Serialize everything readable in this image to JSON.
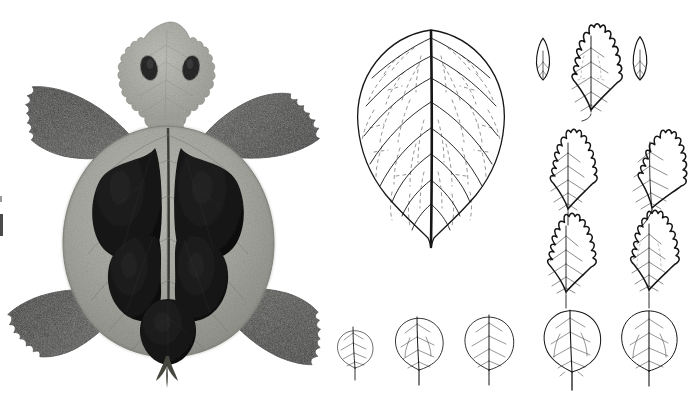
{
  "plate": {
    "title": "Leaf-composition turtle and comparative leaf outline drawings",
    "background_color": "#ffffff",
    "width": 695,
    "height": 408,
    "medium": "grayscale photographic collage (left) and pen line drawings (right)"
  },
  "palette": {
    "background": "#ffffff",
    "ink": "#1a1a1a",
    "vein_light": "#8a8a8a",
    "shell_light": "#a9a9a4",
    "shell_mid": "#9b9b96",
    "spot_dark": "#151515",
    "flipper_dark": "#4a4a48",
    "head_light": "#b4b4ae"
  },
  "left_panel": {
    "name": "leaf-turtle-collage",
    "caption": "Turtle figure assembled from pressed leaves",
    "parts": [
      {
        "id": "head",
        "label": "Head",
        "description": "pale gray crenate leaf, apex up",
        "tone": "#b4b4ae"
      },
      {
        "id": "eye-left",
        "label": "Left eye",
        "description": "small dark oval leaf spot",
        "tone": "#2b2b2b"
      },
      {
        "id": "eye-right",
        "label": "Right eye",
        "description": "small dark oval leaf spot",
        "tone": "#2b2b2b"
      },
      {
        "id": "carapace",
        "label": "Carapace",
        "description": "large pale ovate leaf with central midrib",
        "tone": "#a9a9a4"
      },
      {
        "id": "scute-upper-left",
        "label": "Upper left scute",
        "description": "dark rounded leaf",
        "tone": "#151515"
      },
      {
        "id": "scute-upper-right",
        "label": "Upper right scute",
        "description": "dark rounded leaf",
        "tone": "#151515"
      },
      {
        "id": "scute-lower-left",
        "label": "Lower left scute",
        "description": "dark rounded leaf",
        "tone": "#151515"
      },
      {
        "id": "scute-lower-right",
        "label": "Lower right scute",
        "description": "dark rounded leaf",
        "tone": "#151515"
      },
      {
        "id": "scute-rear",
        "label": "Rear scute",
        "description": "dark ovate leaf at tail end",
        "tone": "#151515"
      },
      {
        "id": "flipper-front-left",
        "label": "Front left flipper",
        "description": "dark serrate leaf",
        "tone": "#4a4a48"
      },
      {
        "id": "flipper-front-right",
        "label": "Front right flipper",
        "description": "dark serrate leaf",
        "tone": "#4a4a48"
      },
      {
        "id": "flipper-rear-left",
        "label": "Rear left flipper",
        "description": "dark serrate leaf",
        "tone": "#4a4a48"
      },
      {
        "id": "flipper-rear-right",
        "label": "Rear right flipper",
        "description": "dark serrate leaf",
        "tone": "#4a4a48"
      },
      {
        "id": "tail",
        "label": "Tail",
        "description": "leaf petiole",
        "tone": "#3a3a38"
      }
    ],
    "scute_count": 5,
    "flipper_count": 4
  },
  "right_panel": {
    "name": "leaf-outline-drawings",
    "caption": "Comparative leaf outline drawings",
    "groups": [
      {
        "id": "specimen-large",
        "label": "Large ovate leaf",
        "count": 1,
        "description": "large cordate-ovate leaf with heavy midrib and fine reticulate venation"
      },
      {
        "id": "bract-row",
        "label": "Bud scales and serrate leaf",
        "count": 3,
        "items": [
          {
            "id": "bract-left",
            "label": "Left bud scale"
          },
          {
            "id": "leaf-serrate-center",
            "label": "Serrate ovate leaf"
          },
          {
            "id": "bract-right",
            "label": "Right bud scale"
          }
        ]
      },
      {
        "id": "serrate-grid",
        "label": "Serrate leaf series",
        "count": 4,
        "items": [
          {
            "id": "serrate-1",
            "label": "Serrate leaf 1"
          },
          {
            "id": "serrate-2",
            "label": "Serrate leaf 2"
          },
          {
            "id": "serrate-3",
            "label": "Serrate leaf 3"
          },
          {
            "id": "serrate-4",
            "label": "Serrate leaf 4"
          }
        ]
      },
      {
        "id": "orbicular-row",
        "label": "Orbicular leaf series, increasing size",
        "count": 5,
        "items": [
          {
            "id": "orbicular-1",
            "label": "Orbicular leaf 1",
            "relative_size": 0.62
          },
          {
            "id": "orbicular-2",
            "label": "Orbicular leaf 2",
            "relative_size": 0.84
          },
          {
            "id": "orbicular-3",
            "label": "Orbicular leaf 3",
            "relative_size": 0.86
          },
          {
            "id": "orbicular-4",
            "label": "Orbicular leaf 4",
            "relative_size": 1.0
          },
          {
            "id": "orbicular-5",
            "label": "Orbicular leaf 5",
            "relative_size": 0.98
          }
        ]
      }
    ]
  },
  "artifacts": [
    {
      "id": "left-edge-mark",
      "label": "scan edge mark",
      "position": "left margin"
    }
  ]
}
